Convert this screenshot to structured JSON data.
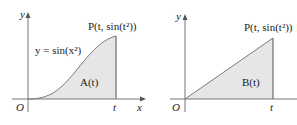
{
  "colors": {
    "axis": "#555555",
    "curve": "#7a7a7a",
    "fill": "#e6e6e6",
    "text": "#222222"
  },
  "left_graph": {
    "y_axis_label": "y",
    "x_axis_label": "x",
    "origin_label": "O",
    "t_label": "t",
    "curve_label": "y = sin(x²)",
    "point_label": "P(t, sin(t²))",
    "area_label": "A(t)"
  },
  "right_graph": {
    "y_axis_label": "y",
    "origin_label": "O",
    "t_label": "t",
    "point_label": "P(t, sin(t²))",
    "area_label": "B(t)"
  }
}
